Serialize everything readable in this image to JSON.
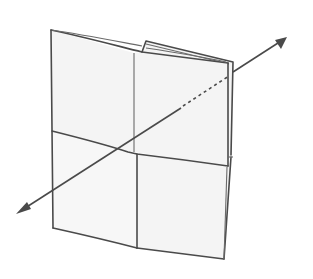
{
  "figure": {
    "colors": {
      "paper_fill": "#f4f4f4",
      "line": "#4a4a4a",
      "background": "#ffffff"
    },
    "elements": {
      "sheet": "folded-paper",
      "axis": "double-headed-axis-arrow",
      "hidden_axis_segment": "dashed"
    }
  }
}
